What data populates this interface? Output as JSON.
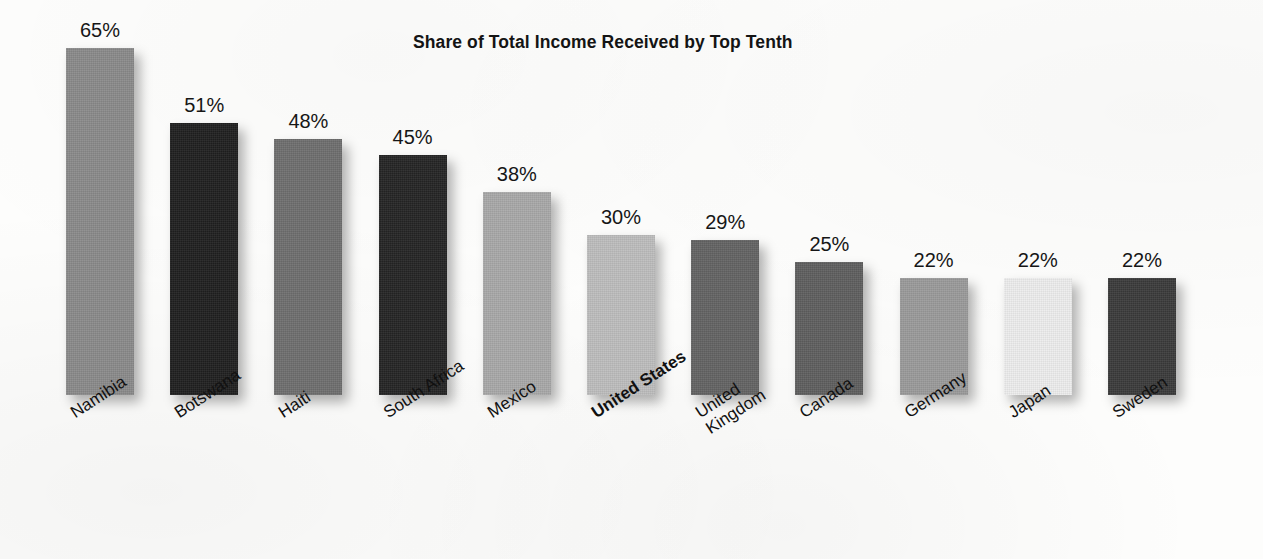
{
  "chart_data": {
    "type": "bar",
    "title": "Share of Total Income Received by Top Tenth",
    "xlabel": "",
    "ylabel": "",
    "ylim": [
      0,
      70
    ],
    "grid": false,
    "legend": "none",
    "orientation": "vertical",
    "value_suffix": "%",
    "categories": [
      "Namibia",
      "Botswana",
      "Haiti",
      "South Africa",
      "Mexico",
      "United States",
      "United\nKingdom",
      "Canada",
      "Germany",
      "Japan",
      "Sweden"
    ],
    "values": [
      65,
      51,
      48,
      45,
      38,
      30,
      29,
      25,
      22,
      22,
      22
    ],
    "value_labels": [
      "65%",
      "51%",
      "48%",
      "45%",
      "38%",
      "30%",
      "29%",
      "25%",
      "22%",
      "22%",
      "22%"
    ],
    "bar_colors": [
      "#8a8a8a",
      "#1f1f1f",
      "#6e6e6e",
      "#242424",
      "#a8a8a8",
      "#bdbdbd",
      "#636363",
      "#5e5e5e",
      "#9a9a9a",
      "#ededed",
      "#3a3a3a"
    ],
    "highlighted_category": "United States",
    "background_color": "#fdfdfc",
    "text_color": "#141414"
  }
}
